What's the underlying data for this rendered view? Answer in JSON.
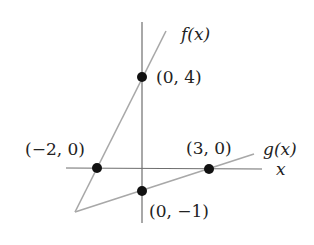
{
  "diagram": {
    "type": "graph-of-lines",
    "axes": {
      "x_label": "x",
      "color": "#6e6e6e"
    },
    "functions": [
      {
        "name": "f",
        "label": "f(x)",
        "color": "#a8a8a8",
        "points": [
          "(-2, 0)",
          "(0, 4)"
        ]
      },
      {
        "name": "g",
        "label": "g(x)",
        "color": "#a8a8a8",
        "points": [
          "(0, -1)",
          "(3, 0)"
        ]
      }
    ],
    "points": [
      {
        "label": "(0, 4)"
      },
      {
        "label": "(−2, 0)"
      },
      {
        "label": "(3, 0)"
      },
      {
        "label": "(0, −1)"
      }
    ],
    "dot_color": "#111111"
  }
}
